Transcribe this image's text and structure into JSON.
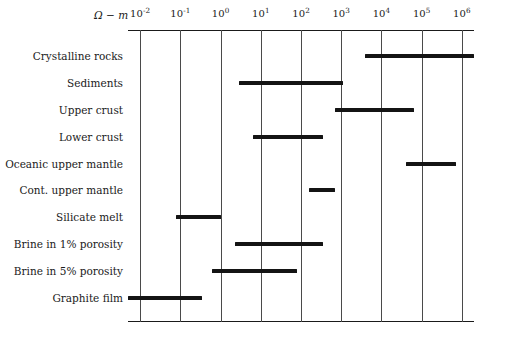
{
  "chart_data": {
    "type": "bar",
    "orientation": "horizontal",
    "title": "",
    "xlabel": "Ω − m",
    "ylabel": "",
    "xscale": "log",
    "xlim": [
      -2.3,
      6.3
    ],
    "grid": true,
    "legend": null,
    "x_unit_label": "Ω − m",
    "x_tick_labels": [
      "10",
      "10",
      "10",
      "10",
      "10",
      "10",
      "10",
      "10",
      "10"
    ],
    "x_tick_exponents": [
      "-2",
      "-1",
      "0",
      "1",
      "2",
      "3",
      "4",
      "5",
      "6"
    ],
    "x_tick_values": [
      -2,
      -1,
      0,
      1,
      2,
      3,
      4,
      5,
      6
    ],
    "categories": [
      "Crystalline rocks",
      "Sediments",
      "Upper crust",
      "Lower crust",
      "Oceanic upper mantle",
      "Cont. upper mantle",
      "Silicate melt",
      "Brine in 1% porosity",
      "Brine in 5% porosity",
      "Graphite film"
    ],
    "ranges": [
      {
        "label": "Crystalline rocks",
        "log_min": 3.6,
        "log_max": 6.3
      },
      {
        "label": "Sediments",
        "log_min": 0.45,
        "log_max": 3.05
      },
      {
        "label": "Upper crust",
        "log_min": 2.85,
        "log_max": 4.8
      },
      {
        "label": "Lower crust",
        "log_min": 0.8,
        "log_max": 2.55
      },
      {
        "label": "Oceanic upper mantle",
        "log_min": 4.6,
        "log_max": 5.85
      },
      {
        "label": "Cont. upper mantle",
        "log_min": 2.2,
        "log_max": 2.85
      },
      {
        "label": "Silicate melt",
        "log_min": -1.1,
        "log_max": 0.0
      },
      {
        "label": "Brine in 1% porosity",
        "log_min": 0.35,
        "log_max": 2.55
      },
      {
        "label": "Brine in 5% porosity",
        "log_min": -0.2,
        "log_max": 1.9
      },
      {
        "label": "Graphite film",
        "log_min": -2.3,
        "log_max": -0.45
      }
    ],
    "bar_color": "#141414",
    "gridline_color": "#4a4a4a"
  }
}
